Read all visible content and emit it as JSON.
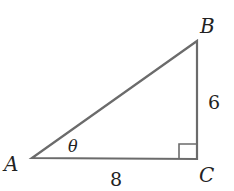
{
  "diagram": {
    "type": "right-triangle",
    "vertices": {
      "A": {
        "label": "A"
      },
      "B": {
        "label": "B"
      },
      "C": {
        "label": "C"
      }
    },
    "sides": {
      "AC": {
        "label": "8"
      },
      "BC": {
        "label": "6"
      }
    },
    "angle": {
      "label": "θ",
      "at": "A"
    },
    "right_angle_at": "C",
    "colors": {
      "stroke": "#6b6b6b",
      "text": "#222222"
    }
  }
}
